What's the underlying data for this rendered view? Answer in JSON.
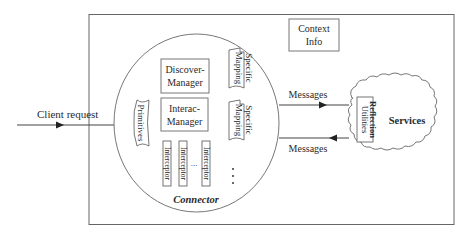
{
  "diagram": {
    "client_request": {
      "label": "Client request"
    },
    "context_info": {
      "line1": "Context",
      "line2": "Info"
    },
    "connector": {
      "label": "Connector",
      "primitives": "Primitives",
      "discover_manager": {
        "line1": "Discover-",
        "line2": "Manager"
      },
      "interac_manager": {
        "line1": "Interac-",
        "line2": "Manager"
      },
      "interceptors": [
        "Interceptor",
        "Interceptor",
        "Interceptor"
      ],
      "interceptor_ellipsis": "...",
      "specific_mappings": [
        {
          "line1": "Specific",
          "line2": "Mapping"
        },
        {
          "line1": "Specific",
          "line2": "Mapping"
        }
      ],
      "mapping_ellipsis": "..."
    },
    "messages_out": {
      "label": "Messages",
      "direction": "right"
    },
    "messages_in": {
      "label": "Messages",
      "direction": "left"
    },
    "services": {
      "label": "Services",
      "reflection_utilities": {
        "line1": "Reflection",
        "line2": "Utilities"
      }
    },
    "colors": {
      "line": "#555555",
      "text": "#2a2a2a",
      "background": "#ffffff"
    }
  }
}
